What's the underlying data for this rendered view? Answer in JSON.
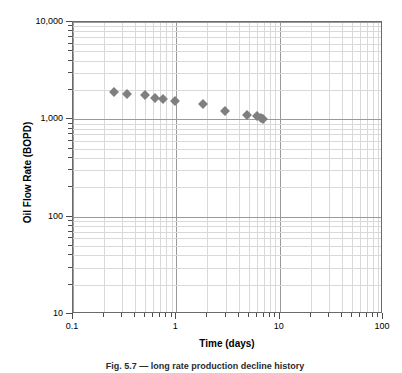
{
  "chart_data": {
    "type": "scatter",
    "title": "",
    "xlabel": "Time (days)",
    "ylabel": "Oil Flow Rate (BOPD)",
    "xscale": "log",
    "yscale": "log",
    "xlim": [
      0.1,
      100
    ],
    "ylim": [
      10,
      10000
    ],
    "grid": true,
    "legend": null,
    "marker": "diamond",
    "marker_color": "#7f7f7f",
    "xticks": [
      "0.1",
      "1",
      "10",
      "100"
    ],
    "xtick_values": [
      0.1,
      1,
      10,
      100
    ],
    "yticks": [
      "10",
      "100",
      "1,000",
      "10,000"
    ],
    "ytick_values": [
      10,
      100,
      1000,
      10000
    ],
    "series": [
      {
        "name": "Oil Flow Rate",
        "points": [
          {
            "x": 0.25,
            "y": 1900
          },
          {
            "x": 0.33,
            "y": 1830
          },
          {
            "x": 0.5,
            "y": 1760
          },
          {
            "x": 0.62,
            "y": 1640
          },
          {
            "x": 0.74,
            "y": 1610
          },
          {
            "x": 0.96,
            "y": 1560
          },
          {
            "x": 1.8,
            "y": 1430
          },
          {
            "x": 2.95,
            "y": 1210
          },
          {
            "x": 4.85,
            "y": 1110
          },
          {
            "x": 6.0,
            "y": 1070
          },
          {
            "x": 6.55,
            "y": 1030
          },
          {
            "x": 6.9,
            "y": 1000
          }
        ]
      }
    ]
  },
  "axes": {
    "y_title": "Oil Flow Rate (BOPD)",
    "x_title": "Time (days)",
    "y_tick_labels": [
      "10,000",
      "1,000",
      "100",
      "10"
    ],
    "x_tick_labels": [
      "0.1",
      "1",
      "10",
      "100"
    ]
  },
  "caption": {
    "text": "Fig. 5.7 — long rate production decline history"
  },
  "colors": {
    "marker": "#7f7f7f",
    "major_grid": "#9a9a9a",
    "minor_grid": "#d9d9d9",
    "frame": "#6b6b6b",
    "text": "#000000"
  }
}
